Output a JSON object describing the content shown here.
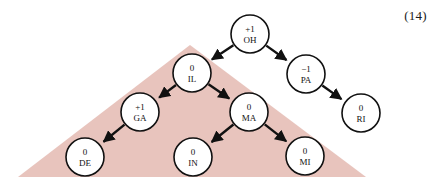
{
  "figure": {
    "equation_number": "(14)",
    "width": 437,
    "height": 192,
    "background_color": "#ffffff",
    "region": {
      "name": "highlight-triangle",
      "color": "#e8c4bd",
      "points": "190,45 18,177 366,177"
    },
    "node_radius": 19,
    "nodes": [
      {
        "id": "OH",
        "value": "+1",
        "label": "OH",
        "cx": 250,
        "cy": 34,
        "in_region": false
      },
      {
        "id": "IL",
        "value": "0",
        "label": "IL",
        "cx": 192,
        "cy": 73,
        "in_region": true
      },
      {
        "id": "PA",
        "value": "−1",
        "label": "PA",
        "cx": 306,
        "cy": 74,
        "in_region": false
      },
      {
        "id": "GA",
        "value": "+1",
        "label": "GA",
        "cx": 140,
        "cy": 112,
        "in_region": true
      },
      {
        "id": "MA",
        "value": "0",
        "label": "MA",
        "cx": 249,
        "cy": 112,
        "in_region": true
      },
      {
        "id": "RI",
        "value": "0",
        "label": "RI",
        "cx": 361,
        "cy": 113,
        "in_region": false
      },
      {
        "id": "DE",
        "value": "0",
        "label": "DE",
        "cx": 85,
        "cy": 157,
        "in_region": true
      },
      {
        "id": "IN",
        "value": "0",
        "label": "IN",
        "cx": 193,
        "cy": 157,
        "in_region": true
      },
      {
        "id": "MI",
        "value": "0",
        "label": "MI",
        "cx": 305,
        "cy": 156,
        "in_region": true
      }
    ],
    "edges": [
      {
        "from": "OH",
        "to": "IL"
      },
      {
        "from": "OH",
        "to": "PA"
      },
      {
        "from": "PA",
        "to": "RI"
      },
      {
        "from": "IL",
        "to": "GA"
      },
      {
        "from": "IL",
        "to": "MA"
      },
      {
        "from": "GA",
        "to": "DE"
      },
      {
        "from": "MA",
        "to": "IN"
      },
      {
        "from": "MA",
        "to": "MI"
      }
    ]
  }
}
